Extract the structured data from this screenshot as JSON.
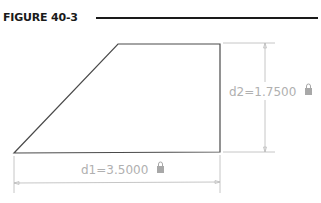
{
  "figure": {
    "label": "FIGURE 40-3"
  },
  "diagram": {
    "shape": "trapezoid",
    "vertices": [
      [
        14,
        153
      ],
      [
        118,
        44
      ],
      [
        220,
        44
      ],
      [
        220,
        152
      ]
    ],
    "dimensions": [
      {
        "name": "d1",
        "text": "d1=3.5000",
        "value": 3.5,
        "orientation": "horizontal",
        "locked": true
      },
      {
        "name": "d2",
        "text": "d2=1.7500",
        "value": 1.75,
        "orientation": "vertical",
        "locked": true
      }
    ]
  },
  "colors": {
    "shape_stroke": "#4a4a4a",
    "dimension": "#b0b0b0",
    "text": "#1a1a1a"
  }
}
